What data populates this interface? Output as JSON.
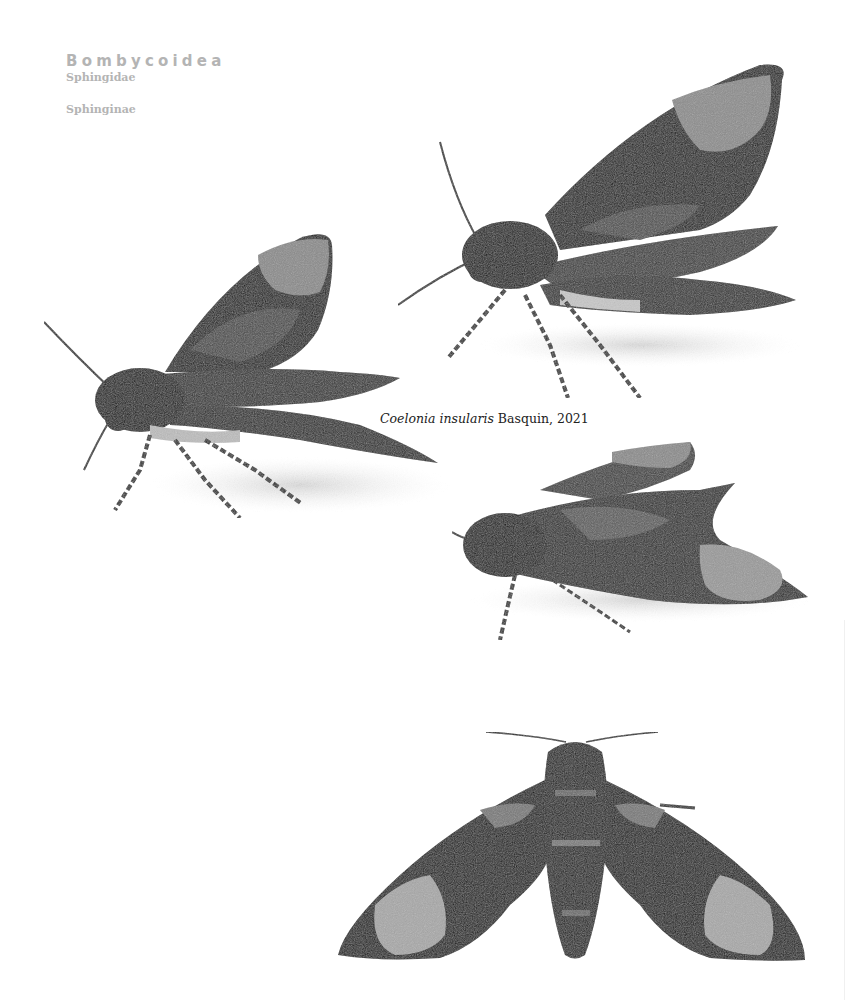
{
  "taxonomy": {
    "superfamily": "Bombycoidea",
    "family": "Sphingidae",
    "subfamily": "Sphinginae"
  },
  "caption": {
    "genus_species": "Coelonia insularis",
    "author_year": "Basquin, 2021"
  },
  "specimens": [
    {
      "view": "lateral-left-upper",
      "subject": "moth"
    },
    {
      "view": "lateral-left-middle",
      "subject": "moth"
    },
    {
      "view": "lateral-left-resting",
      "subject": "moth"
    },
    {
      "view": "dorsal-spread",
      "subject": "moth"
    }
  ],
  "colors": {
    "background": "#ffffff",
    "heading_gray": "#b4b4b4",
    "caption_text": "#222222"
  }
}
